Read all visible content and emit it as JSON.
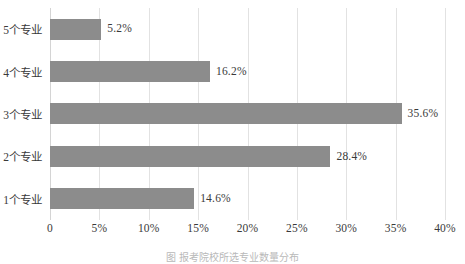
{
  "chart_data": {
    "type": "bar",
    "orientation": "horizontal",
    "title": "",
    "subtitle": "",
    "xlabel": "",
    "ylabel": "",
    "categories": [
      "1个专业",
      "2个专业",
      "3个专业",
      "4个专业",
      "5个专业"
    ],
    "values": [
      14.6,
      28.4,
      35.6,
      16.2,
      5.2
    ],
    "value_labels": [
      "14.6%",
      "28.4%",
      "35.6%",
      "16.2%",
      "5.2%"
    ],
    "display_order_top_to_bottom": [
      "5个专业",
      "4个专业",
      "3个专业",
      "2个专业",
      "1个专业"
    ],
    "xlim": [
      0,
      40
    ],
    "xtick_values": [
      0,
      5,
      10,
      15,
      20,
      25,
      30,
      35,
      40
    ],
    "xtick_labels": [
      "0",
      "5%",
      "10%",
      "15%",
      "20%",
      "25%",
      "30%",
      "35%",
      "40%"
    ],
    "grid": true,
    "grid_axis": "x",
    "legend": false,
    "legend_position": "none",
    "bar_color": "#8c8c8c",
    "gridline_color": "#e2e2e2",
    "background_color": "#ffffff",
    "text_color": "#3a3a3a"
  },
  "caption": {
    "text": "图 报考院校所选专业数量分布"
  }
}
